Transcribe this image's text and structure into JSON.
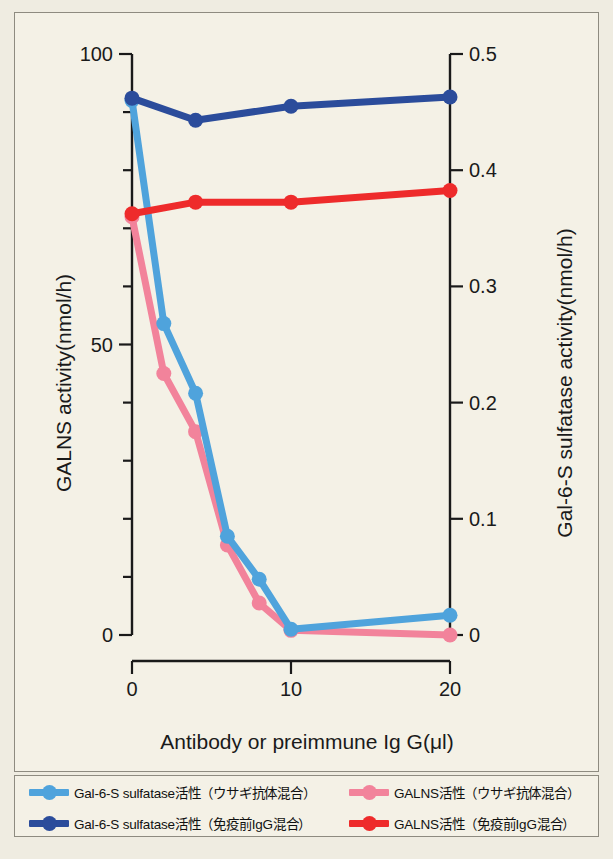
{
  "chart_data": {
    "type": "line",
    "title": "",
    "xlabel": "Antibody or preimmune Ig G(μl)",
    "ylabel_left": "GALNS activity(nmol/h)",
    "ylabel_right": "Gal-6-S sulfatase activity(nmol/h)",
    "xlim": [
      0,
      20
    ],
    "ylim_left": [
      0,
      100
    ],
    "ylim_right": [
      0,
      0.5
    ],
    "xticks": [
      0,
      10,
      20
    ],
    "xticklabels": [
      "0",
      "10",
      "20"
    ],
    "yticks_left": [
      0,
      10,
      20,
      30,
      40,
      50,
      60,
      70,
      80,
      90,
      100
    ],
    "yticklabels_left": [
      "0",
      "",
      "",
      "",
      "",
      "50",
      "",
      "",
      "",
      "",
      "100"
    ],
    "yticks_right": [
      0,
      0.1,
      0.2,
      0.3,
      0.4,
      0.5
    ],
    "yticklabels_right": [
      "0",
      "0.1",
      "0.2",
      "0.3",
      "0.4",
      "0.5"
    ],
    "grid": false,
    "legend_position": "below-plot",
    "series": [
      {
        "name": "Gal-6-S sulfatase活性（ウサギ抗体混合）",
        "short_name": "gal6s-rabbit-antibody",
        "axis": "right",
        "color": "#4FA3DC",
        "x": [
          0,
          2,
          4,
          6,
          8,
          10,
          20
        ],
        "y_right": [
          0.46,
          0.268,
          0.208,
          0.085,
          0.048,
          0.005,
          0.017
        ],
        "y_left_equivalent": [
          92.0,
          53.5,
          41.5,
          17.0,
          9.5,
          1.0,
          3.4
        ]
      },
      {
        "name": "GALNS活性（ウサギ抗体混合）",
        "short_name": "galns-rabbit-antibody",
        "axis": "left",
        "color": "#F2839B",
        "x": [
          0,
          2,
          4,
          6,
          8,
          10,
          20
        ],
        "y_left": [
          72.0,
          45.0,
          35.0,
          15.5,
          5.5,
          0.8,
          0.0
        ],
        "y_right_equivalent": [
          0.36,
          0.225,
          0.175,
          0.078,
          0.028,
          0.004,
          0.0
        ]
      },
      {
        "name": "Gal-6-S sulfatase活性（免疫前IgG混合）",
        "short_name": "gal6s-preimmune-igg",
        "axis": "right",
        "color": "#2B4C9B",
        "x": [
          0,
          4,
          10,
          20
        ],
        "y_right": [
          0.462,
          0.443,
          0.455,
          0.463
        ],
        "y_left_equivalent": [
          92.4,
          88.6,
          91.0,
          92.6
        ]
      },
      {
        "name": "GALNS活性（免疫前IgG混合）",
        "short_name": "galns-preimmune-igg",
        "axis": "left",
        "color": "#EE2B2B",
        "x": [
          0,
          4,
          10,
          20
        ],
        "y_left": [
          72.5,
          74.5,
          74.5,
          76.5
        ],
        "y_right_equivalent": [
          0.3625,
          0.3725,
          0.3725,
          0.3825
        ]
      }
    ]
  },
  "legend": {
    "entries": [
      {
        "label": "Gal-6-S sulfatase活性（ウサギ抗体混合）",
        "color": "#4FA3DC"
      },
      {
        "label": "GALNS活性（ウサギ抗体混合）",
        "color": "#F2839B"
      },
      {
        "label": "Gal-6-S sulfatase活性（免疫前IgG混合）",
        "color": "#2B4C9B"
      },
      {
        "label": "GALNS活性（免疫前IgG混合）",
        "color": "#EE2B2B"
      }
    ]
  },
  "colors": {
    "background": "#f4f1e6",
    "page": "#efece1",
    "frame": "#8e8b80",
    "axis": "#1a1a1a",
    "light_blue": "#4FA3DC",
    "dark_blue": "#2B4C9B",
    "pink": "#F2839B",
    "red": "#EE2B2B"
  }
}
